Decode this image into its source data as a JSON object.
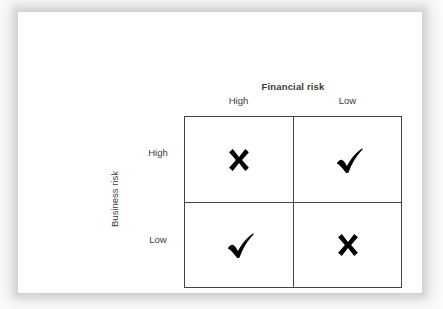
{
  "figure": {
    "column_axis_title": "Financial risk",
    "column_headers": [
      "High",
      "Low"
    ],
    "row_axis_title": "Business risk",
    "row_headers": [
      "High",
      "Low"
    ],
    "cells": [
      {
        "row": "High",
        "column": "High",
        "mark": "cross-icon",
        "meaning": "unfavourable"
      },
      {
        "row": "High",
        "column": "Low",
        "mark": "check-icon",
        "meaning": "favourable"
      },
      {
        "row": "Low",
        "column": "High",
        "mark": "check-icon",
        "meaning": "favourable"
      },
      {
        "row": "Low",
        "column": "Low",
        "mark": "cross-icon",
        "meaning": "unfavourable"
      }
    ],
    "colors": {
      "mark": "#000000",
      "grid_line": "#444444",
      "text": "#3c3c3c",
      "card_background": "#ffffff",
      "page_background": "#ffffff"
    }
  }
}
